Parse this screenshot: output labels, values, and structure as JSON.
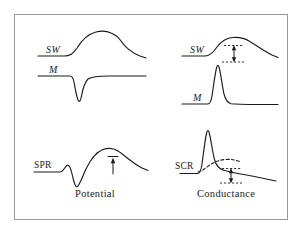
{
  "figure": {
    "background_color": "#ffffff",
    "frame_color": "#9a9a9a",
    "ink_color": "#1b1b1b",
    "panels": [
      {
        "id": "top-left",
        "column": "potential",
        "row": "top",
        "curves": [
          {
            "label": "SW",
            "style": "italic",
            "description": "slow-wave potential: flat baseline rising to a broad rounded positive peak then slow decay"
          },
          {
            "label": "M",
            "style": "italic",
            "description": "monophasic potential: flat baseline with a sharp downward negative deflection returning to baseline"
          }
        ],
        "annotations": []
      },
      {
        "id": "top-right",
        "column": "conductance",
        "row": "top",
        "curves": [
          {
            "label": "SW",
            "style": "italic",
            "description": "slow-wave conductance: flat baseline rising to a broad rounded peak then slow decay"
          },
          {
            "label": "M",
            "style": "italic",
            "description": "monophasic conductance: flat baseline with a sharp upward positive spike decaying back to baseline"
          }
        ],
        "annotations": [
          {
            "type": "double-arrow-vertical",
            "description": "vertical double-headed amplitude arrow between two short dashed tick lines"
          }
        ]
      },
      {
        "id": "bottom-left",
        "column": "potential",
        "row": "bottom",
        "curves": [
          {
            "label": "SPR",
            "style": "upright",
            "description": "skin potential response: small positive bump, sharp negative deflection, then large slow positive wave with gradual decay"
          }
        ],
        "annotations": [
          {
            "type": "single-arrow-up",
            "description": "upward arrow with a short horizontal cap marking the positive wave amplitude"
          }
        ]
      },
      {
        "id": "bottom-right",
        "column": "conductance",
        "row": "bottom",
        "curves": [
          {
            "label": "SCR",
            "style": "upright",
            "description": "skin conductance response: flat baseline with a tall narrow spike decaying to a slowly falling tail"
          },
          {
            "label": "",
            "style": "dashed",
            "description": "dashed broad underlying slow conductance component rising to a low rounded peak"
          }
        ],
        "annotations": [
          {
            "type": "double-arrow-vertical",
            "description": "vertical double-headed amplitude arrow between two short dashed tick lines"
          }
        ]
      }
    ],
    "column_titles": [
      {
        "id": "potential",
        "label": "Potential"
      },
      {
        "id": "conductance",
        "label": "Conductance"
      }
    ]
  }
}
